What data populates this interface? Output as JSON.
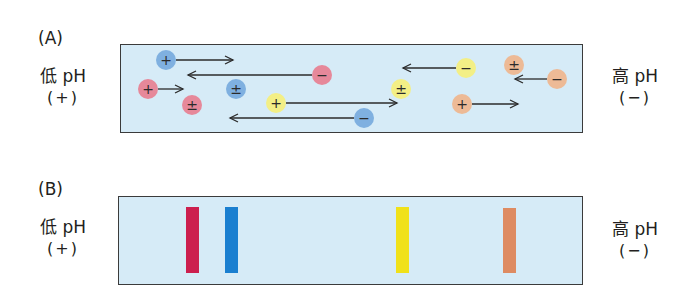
{
  "panels": [
    {
      "label": "(A)",
      "left": {
        "title": "低 pH",
        "sign": "(+)"
      },
      "right": {
        "title": "高 pH",
        "sign": "(−)"
      },
      "box": {
        "x": 120,
        "y": 44,
        "w": 463,
        "h": 89,
        "fill": "#d6ebf7"
      },
      "particles": [
        {
          "protein": "blue",
          "charge": "+",
          "cx": 166,
          "cy": 60,
          "arrow_to": 233
        },
        {
          "protein": "red",
          "charge": "−",
          "cx": 322,
          "cy": 75,
          "arrow_to": 188
        },
        {
          "protein": "red",
          "charge": "+",
          "cx": 148,
          "cy": 89,
          "arrow_to": 183
        },
        {
          "protein": "blue",
          "charge": "±",
          "cx": 236,
          "cy": 89,
          "arrow_to": null
        },
        {
          "protein": "red",
          "charge": "±",
          "cx": 192,
          "cy": 105,
          "arrow_to": null
        },
        {
          "protein": "yellow",
          "charge": "+",
          "cx": 276,
          "cy": 103,
          "arrow_to": 397
        },
        {
          "protein": "blue",
          "charge": "−",
          "cx": 364,
          "cy": 118,
          "arrow_to": 230
        },
        {
          "protein": "yellow",
          "charge": "−",
          "cx": 466,
          "cy": 68,
          "arrow_to": 403
        },
        {
          "protein": "orange",
          "charge": "±",
          "cx": 514,
          "cy": 65,
          "arrow_to": null
        },
        {
          "protein": "orange",
          "charge": "−",
          "cx": 557,
          "cy": 79,
          "arrow_to": 515
        },
        {
          "protein": "yellow",
          "charge": "±",
          "cx": 401,
          "cy": 89,
          "arrow_to": null
        },
        {
          "protein": "orange",
          "charge": "+",
          "cx": 462,
          "cy": 104,
          "arrow_to": 518
        }
      ]
    },
    {
      "label": "(B)",
      "left": {
        "title": "低 pH",
        "sign": "(+)"
      },
      "right": {
        "title": "高 pH",
        "sign": "(−)"
      },
      "box": {
        "x": 118,
        "y": 196,
        "w": 465,
        "h": 89,
        "fill": "#d6ebf7"
      },
      "bands": [
        {
          "protein": "red",
          "x": 186,
          "y": 207,
          "w": 13,
          "h": 66
        },
        {
          "protein": "blue",
          "x": 225,
          "y": 207,
          "w": 13,
          "h": 66
        },
        {
          "protein": "yellow",
          "x": 396,
          "y": 207,
          "w": 13,
          "h": 66
        },
        {
          "protein": "orange",
          "x": 503,
          "y": 208,
          "w": 13,
          "h": 65
        }
      ]
    }
  ],
  "colors": {
    "red_particle": "#e6889a",
    "blue_particle": "#7fb0e0",
    "yellow_particle": "#f3ef86",
    "orange_particle": "#edba96",
    "red_band": "#cc1f4e",
    "blue_band": "#1a7fd0",
    "yellow_band": "#f0e11a",
    "orange_band": "#de8b62",
    "arrow": "#2b2b2b"
  }
}
